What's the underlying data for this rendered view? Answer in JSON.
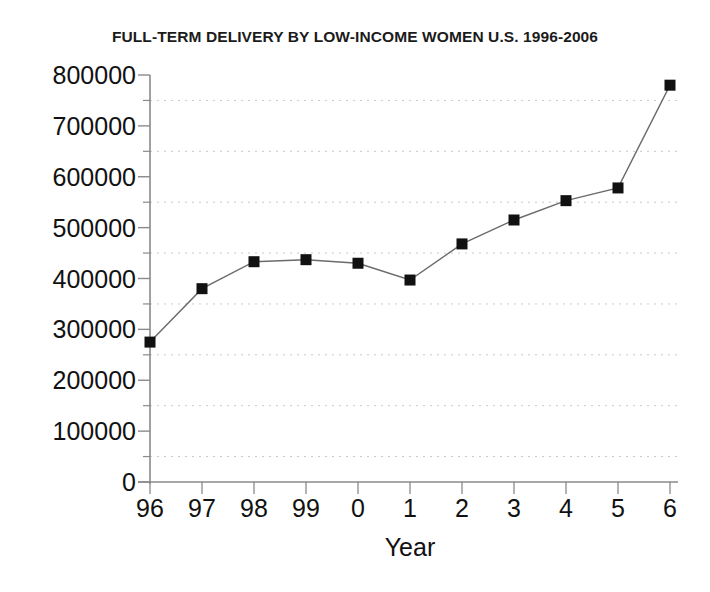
{
  "chart_data": {
    "type": "line",
    "title": "FULL-TERM DELIVERY BY LOW-INCOME WOMEN U.S. 1996-2006",
    "xlabel": "Year",
    "ylabel": "",
    "categories": [
      "96",
      "97",
      "98",
      "99",
      "0",
      "1",
      "2",
      "3",
      "4",
      "5",
      "6"
    ],
    "values": [
      275000,
      380000,
      433000,
      437000,
      430000,
      397000,
      468000,
      515000,
      553000,
      578000,
      780000
    ],
    "series": [
      {
        "name": "Full-term deliveries",
        "values": [
          275000,
          380000,
          433000,
          437000,
          430000,
          397000,
          468000,
          515000,
          553000,
          578000,
          780000
        ]
      }
    ],
    "ylim": [
      0,
      800000
    ],
    "ytick_labels": [
      "800000",
      "700000",
      "600000",
      "500000",
      "400000",
      "300000",
      "200000",
      "100000",
      "0"
    ],
    "ytick_values": [
      800000,
      700000,
      600000,
      500000,
      400000,
      300000,
      200000,
      100000,
      0
    ],
    "ytick_step": 100000,
    "minor_gridline_step": 50000,
    "grid": "horizontal-dotted-minor",
    "legend": "none",
    "marker": "square",
    "marker_color": "#111111",
    "line_color": "#6b6b6b",
    "gridline_color": "#c9c9c9",
    "axis_color": "#8a8a8a",
    "background": "#ffffff"
  }
}
